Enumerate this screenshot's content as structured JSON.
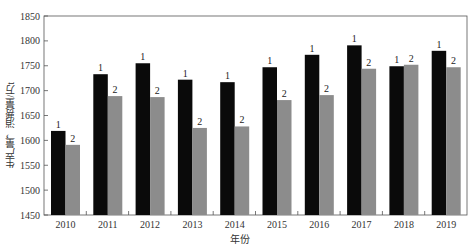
{
  "chart_data": {
    "type": "bar",
    "title": "",
    "xlabel": "年份",
    "ylabel": "生产量，消费量/万t",
    "ylim": [
      1450,
      1850
    ],
    "yticks": [
      1450,
      1500,
      1550,
      1600,
      1650,
      1700,
      1750,
      1800,
      1850
    ],
    "grid": false,
    "legend": "none (bars labeled 1 and 2 above each bar)",
    "categories": [
      "2010",
      "2011",
      "2012",
      "2013",
      "2014",
      "2015",
      "2016",
      "2017",
      "2018",
      "2019"
    ],
    "series": [
      {
        "name": "1",
        "label": "1",
        "color": "#0a0a0a",
        "values": [
          1619,
          1733,
          1755,
          1722,
          1717,
          1747,
          1772,
          1791,
          1749,
          1780
        ]
      },
      {
        "name": "2",
        "label": "2",
        "color": "#8c8c8c",
        "values": [
          1591,
          1689,
          1687,
          1625,
          1628,
          1681,
          1691,
          1744,
          1752,
          1747
        ]
      }
    ]
  },
  "axes": {
    "xlabel": "年份",
    "ylabel": "生产量，消费量/万t"
  }
}
